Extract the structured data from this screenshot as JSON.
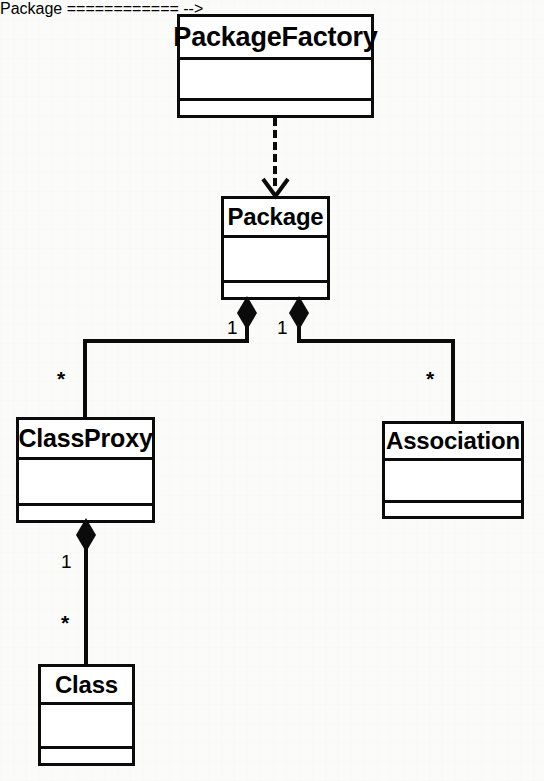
{
  "diagram": {
    "type": "uml-class-diagram",
    "background_color": "#fbfbfa",
    "line_color": "#0b0b0b",
    "classes": [
      {
        "id": "package-factory",
        "name": "PackageFactory",
        "attributes": [],
        "operations": [],
        "x": 177,
        "y": 14,
        "width": 197,
        "height": 104
      },
      {
        "id": "package",
        "name": "Package",
        "attributes": [],
        "operations": [],
        "x": 221,
        "y": 196,
        "width": 109,
        "height": 104
      },
      {
        "id": "class-proxy",
        "name": "ClassProxy",
        "attributes": [],
        "operations": [],
        "x": 16,
        "y": 417,
        "width": 139,
        "height": 106
      },
      {
        "id": "association",
        "name": "Association",
        "attributes": [],
        "operations": [],
        "x": 382,
        "y": 421,
        "width": 142,
        "height": 98
      },
      {
        "id": "class",
        "name": "Class",
        "attributes": [],
        "operations": [],
        "x": 38,
        "y": 664,
        "width": 97,
        "height": 102
      }
    ],
    "relationships": [
      {
        "id": "rel-factory-package",
        "kind": "dependency",
        "style": "dashed-open-arrow",
        "from": "package-factory",
        "to": "package",
        "source_multiplicity": "",
        "target_multiplicity": ""
      },
      {
        "id": "rel-package-classproxy",
        "kind": "composition",
        "style": "filled-diamond",
        "from": "package",
        "to": "class-proxy",
        "source_multiplicity": "1",
        "target_multiplicity": "*"
      },
      {
        "id": "rel-package-association",
        "kind": "composition",
        "style": "filled-diamond",
        "from": "package",
        "to": "association",
        "source_multiplicity": "1",
        "target_multiplicity": "*"
      },
      {
        "id": "rel-classproxy-class",
        "kind": "composition",
        "style": "filled-diamond",
        "from": "class-proxy",
        "to": "class",
        "source_multiplicity": "1",
        "target_multiplicity": "*"
      }
    ],
    "multiplicity_labels": [
      {
        "id": "mult-package-left",
        "text": "1",
        "x": 227,
        "y": 318
      },
      {
        "id": "mult-package-right",
        "text": "1",
        "x": 277,
        "y": 318
      },
      {
        "id": "mult-classproxy-top",
        "text": "*",
        "x": 57,
        "y": 368
      },
      {
        "id": "mult-association-top",
        "text": "*",
        "x": 426,
        "y": 368
      },
      {
        "id": "mult-classproxy-bottom",
        "text": "1",
        "x": 61,
        "y": 552
      },
      {
        "id": "mult-class-top",
        "text": "*",
        "x": 61,
        "y": 612
      }
    ]
  }
}
